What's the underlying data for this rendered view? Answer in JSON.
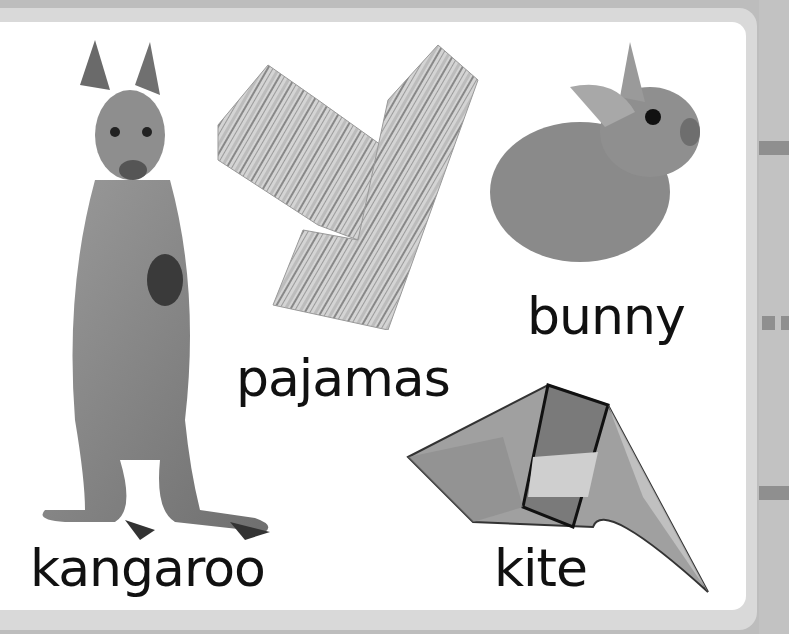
{
  "page": {
    "background_color": "#bdbdbd",
    "card_color": "#ffffff",
    "tab_color": "#8f8f8f"
  },
  "items": [
    {
      "label": "kangaroo",
      "image": "kangaroo-photo"
    },
    {
      "label": "pajamas",
      "image": "striped-pajamas-photo"
    },
    {
      "label": "bunny",
      "image": "bunny-photo"
    },
    {
      "label": "kite",
      "image": "kite-photo"
    }
  ]
}
